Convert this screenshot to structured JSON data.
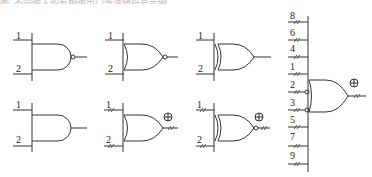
{
  "caption": "图: 不同输入的反相输出门等逻辑符号示例",
  "gates": [
    {
      "id": "nand",
      "type": "AND",
      "inverted_output": true,
      "inputs": [
        "1",
        "2"
      ]
    },
    {
      "id": "nor",
      "type": "OR",
      "inverted_output": true,
      "inputs": [
        "1",
        "2"
      ]
    },
    {
      "id": "xor",
      "type": "XOR",
      "inverted_output": false,
      "inputs": [
        "1",
        "2"
      ]
    },
    {
      "id": "and",
      "type": "AND",
      "inverted_output": false,
      "inputs": [
        "1",
        "2"
      ]
    },
    {
      "id": "or-bus",
      "type": "OR",
      "inverted_output": false,
      "inputs": [
        "1",
        "2"
      ],
      "marker": "⊕"
    },
    {
      "id": "xnor-bus",
      "type": "XOR",
      "inverted_output": true,
      "inputs": [
        "1",
        "2"
      ],
      "marker": "⊕"
    },
    {
      "id": "multi-or",
      "type": "OR",
      "inputs": [
        "8",
        "6",
        "4",
        "1",
        "2",
        "3",
        "5",
        "7",
        "9"
      ],
      "inverted_inputs": [
        "2",
        "3"
      ],
      "marker": "⊕"
    }
  ],
  "labels": {
    "g1_in1": "1",
    "g1_in2": "2",
    "g2_in1": "1",
    "g2_in2": "2",
    "g3_in1": "1",
    "g3_in2": "2",
    "g4_in1": "1",
    "g4_in2": "2",
    "g5_in1": "1",
    "g5_in2": "2",
    "g6_in1": "1",
    "g6_in2": "2",
    "big": [
      "8",
      "6",
      "4",
      "1",
      "2",
      "3",
      "5",
      "7",
      "9"
    ],
    "marker": "⊕"
  }
}
